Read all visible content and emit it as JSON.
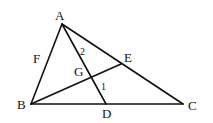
{
  "diagram": {
    "type": "geometry-triangle",
    "stroke_color": "#111111",
    "background": "#ffffff",
    "points": {
      "A": {
        "label": "A",
        "x": 62,
        "y": 24
      },
      "B": {
        "label": "B",
        "x": 31,
        "y": 104
      },
      "C": {
        "label": "C",
        "x": 183,
        "y": 104
      },
      "D": {
        "label": "D",
        "x": 106,
        "y": 104
      },
      "E": {
        "label": "E",
        "x": 121,
        "y": 64
      },
      "F": {
        "label": "F"
      },
      "G": {
        "label": "G",
        "x": 91,
        "y": 78
      }
    },
    "segments": [
      "AB",
      "BC",
      "CA",
      "AD",
      "BE"
    ],
    "angle_labels": {
      "angle1": "1",
      "angle2": "2"
    }
  }
}
